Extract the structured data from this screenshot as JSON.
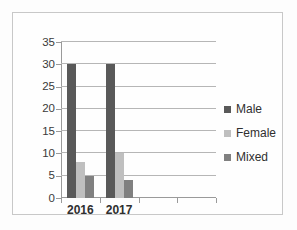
{
  "chart_data": {
    "type": "bar",
    "title": "",
    "xlabel": "",
    "ylabel": "",
    "categories": [
      "2016",
      "2017",
      "",
      ""
    ],
    "series": [
      {
        "name": "Male",
        "color": "#595959",
        "values": [
          30,
          30,
          null,
          null
        ]
      },
      {
        "name": "Female",
        "color": "#bfbfbf",
        "values": [
          8,
          10,
          null,
          null
        ]
      },
      {
        "name": "Mixed",
        "color": "#808080",
        "values": [
          5,
          4,
          null,
          null
        ]
      }
    ],
    "ylim": [
      0,
      35
    ],
    "ytick_values": [
      0,
      5,
      10,
      15,
      20,
      25,
      30,
      35
    ],
    "ytick_labels": [
      "0",
      "5",
      "10",
      "15",
      "20",
      "25",
      "30",
      "35"
    ],
    "grid": true,
    "grid_axis": "y",
    "legend_position": "right"
  },
  "legend": {
    "items": [
      {
        "label": "Male"
      },
      {
        "label": "Female"
      },
      {
        "label": "Mixed"
      }
    ]
  },
  "axis": {
    "y_labels": [
      "35",
      "30",
      "25",
      "20",
      "15",
      "10",
      "5",
      "0"
    ],
    "x_labels": [
      "2016",
      "2017"
    ]
  },
  "colors": {
    "male": "#595959",
    "female": "#bfbfbf",
    "mixed": "#808080",
    "gridline": "#b6b6b6",
    "axis": "#9a9a9a",
    "frame": "#c8c8c8",
    "text": "#2f2f2f",
    "background": "#fefefe"
  }
}
